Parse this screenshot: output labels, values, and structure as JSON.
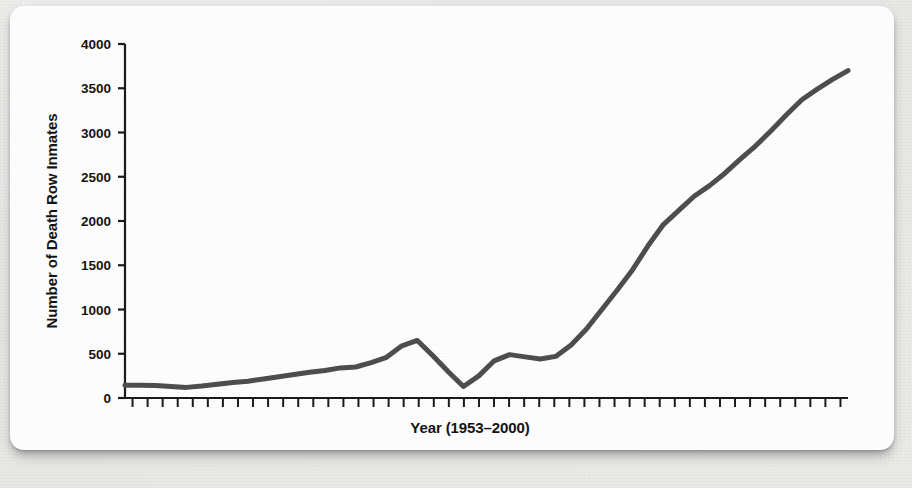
{
  "figure": {
    "background_color": "#e9e9e7",
    "card_color": "#fdfdfd",
    "line_color": "#4d4d4d",
    "axis_color": "#1a1a1a",
    "text_color": "#141414"
  },
  "chart_data": {
    "type": "line",
    "title": "",
    "subtitle": "",
    "xlabel": "Year (1953–2000)",
    "ylabel": "Number of Death Row Inmates",
    "xlim": [
      1953,
      2000
    ],
    "ylim": [
      0,
      4000
    ],
    "grid": false,
    "legend": "none",
    "y_ticks": [
      0,
      500,
      1000,
      1500,
      2000,
      2500,
      3000,
      3500,
      4000
    ],
    "y_tick_labels": [
      "0",
      "500",
      "1000",
      "1500",
      "2000",
      "2500",
      "3000",
      "3500",
      "4000"
    ],
    "x_tick_count": 48,
    "x_tick_labels": [],
    "x": [
      1953,
      1954,
      1955,
      1956,
      1957,
      1958,
      1959,
      1960,
      1961,
      1962,
      1963,
      1964,
      1965,
      1966,
      1967,
      1968,
      1969,
      1970,
      1971,
      1972,
      1973,
      1974,
      1975,
      1976,
      1977,
      1978,
      1979,
      1980,
      1981,
      1982,
      1983,
      1984,
      1985,
      1986,
      1987,
      1988,
      1989,
      1990,
      1991,
      1992,
      1993,
      1994,
      1995,
      1996,
      1997,
      1998,
      1999,
      2000
    ],
    "values": [
      145,
      145,
      140,
      130,
      120,
      135,
      155,
      175,
      190,
      215,
      240,
      265,
      290,
      310,
      340,
      350,
      400,
      460,
      590,
      650,
      480,
      300,
      130,
      250,
      420,
      490,
      465,
      440,
      470,
      600,
      780,
      1000,
      1220,
      1450,
      1720,
      1960,
      2120,
      2280,
      2400,
      2540,
      2700,
      2850,
      3020,
      3200,
      3370,
      3490,
      3600,
      3700
    ],
    "series_name": "Death row inmates",
    "annotations": []
  }
}
